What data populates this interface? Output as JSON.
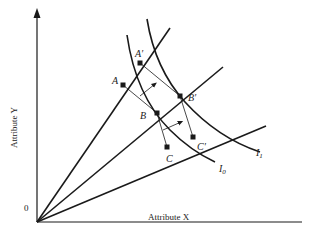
{
  "diagram": {
    "axes": {
      "x_label": "Attribute X",
      "y_label": "Attribute Y",
      "origin_label": "0"
    },
    "points": {
      "A": "A",
      "A_prime": "A′",
      "B": "B",
      "B_prime": "B′",
      "C": "C",
      "C_prime": "C′"
    },
    "curves": {
      "I0": "I",
      "I0_sub": "0",
      "I1": "I",
      "I1_sub": "1"
    },
    "colors": {
      "ink": "#1a1a1a",
      "background": "#ffffff"
    }
  }
}
